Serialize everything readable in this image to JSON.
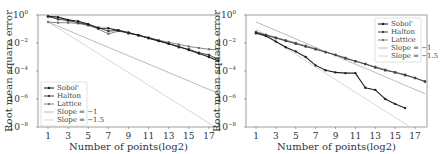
{
  "chart_data": [
    {
      "type": "line",
      "title": "",
      "xlabel": "Number of points(log2)",
      "ylabel": "Root mean square error",
      "yscale": "log",
      "xlim": [
        0,
        18
      ],
      "ylim": [
        1e-08,
        1
      ],
      "x_ticks": [
        "1",
        "3",
        "5",
        "7",
        "9",
        "11",
        "13",
        "15",
        "17"
      ],
      "y_ticks": [
        "10^0",
        "10^-2",
        "10^-4",
        "10^-6",
        "10^-8"
      ],
      "legend_position": "lower left",
      "grid": false,
      "x": [
        1,
        2,
        3,
        4,
        5,
        6,
        7,
        8,
        9,
        10,
        11,
        12,
        13,
        14,
        15,
        16,
        17,
        18
      ],
      "series": [
        {
          "name": "Sobol'",
          "log10_values": [
            -0.1,
            -0.15,
            -0.35,
            -0.45,
            -0.65,
            -0.95,
            -0.95,
            -1.1,
            -1.25,
            -1.45,
            -1.65,
            -1.85,
            -2.05,
            -2.25,
            -2.5,
            -2.75,
            -3.0,
            -3.3
          ]
        },
        {
          "name": "Halton",
          "log10_values": [
            -0.1,
            -0.3,
            -0.4,
            -0.55,
            -0.7,
            -0.9,
            -1.15,
            -1.1,
            -1.3,
            -1.45,
            -1.65,
            -1.85,
            -2.05,
            -2.3,
            -2.45,
            -2.7,
            -2.85,
            -3.2
          ]
        },
        {
          "name": "Lattice",
          "log10_values": [
            -0.5,
            -0.55,
            -0.55,
            -0.6,
            -0.75,
            -1.0,
            -1.35,
            -1.15,
            -1.3,
            -1.45,
            -1.6,
            -1.8,
            -1.95,
            -2.1,
            -2.25,
            -2.35,
            -2.45,
            -2.5
          ]
        },
        {
          "name": "Slope = -1",
          "log10_values": [
            -0.5,
            -0.8,
            -1.1,
            -1.4,
            -1.71,
            -2.01,
            -2.31,
            -2.61,
            -2.91,
            -3.21,
            -3.51,
            -3.81,
            -4.11,
            -4.41,
            -4.71,
            -5.02,
            -5.32,
            -5.62
          ]
        },
        {
          "name": "Slope = -1.5",
          "log10_values": [
            -0.5,
            -0.95,
            -1.4,
            -1.85,
            -2.31,
            -2.76,
            -3.21,
            -3.66,
            -4.11,
            -4.56,
            -5.02,
            -5.47,
            -5.92,
            -6.37,
            -6.82,
            -7.27,
            -7.73,
            -8.18
          ]
        }
      ]
    },
    {
      "type": "line",
      "title": "",
      "xlabel": "Number of points(log2)",
      "ylabel": "Root mean square error",
      "yscale": "log",
      "xlim": [
        0.5,
        18
      ],
      "ylim": [
        1e-08,
        1
      ],
      "x_ticks": [
        "1",
        "3",
        "5",
        "7",
        "9",
        "11",
        "13",
        "15",
        "17"
      ],
      "y_ticks": [
        "10^0",
        "10^-2",
        "10^-4",
        "10^-6",
        "10^-8"
      ],
      "legend_position": "upper right",
      "grid": false,
      "x": [
        1,
        2,
        3,
        4,
        5,
        6,
        7,
        8,
        9,
        10,
        11,
        12,
        13,
        14,
        15,
        16,
        17,
        18
      ],
      "series": [
        {
          "name": "Sobol'",
          "log10_values": [
            -1.3,
            -1.5,
            -1.9,
            -2.3,
            -2.6,
            -3.0,
            -3.6,
            -3.95,
            -4.1,
            -4.15,
            -4.15,
            -5.2,
            -5.35,
            -6.0,
            -6.35,
            -6.65,
            null,
            null
          ]
        },
        {
          "name": "Halton",
          "log10_values": [
            -1.25,
            -1.45,
            -1.65,
            -1.85,
            -2.05,
            -2.25,
            -2.45,
            -2.65,
            -2.85,
            -3.1,
            -3.3,
            -3.5,
            -3.75,
            -3.95,
            -4.1,
            -4.3,
            -4.5,
            -4.75
          ]
        },
        {
          "name": "Lattice",
          "log10_values": [
            -1.2,
            -1.4,
            -1.6,
            -1.8,
            -2.0,
            -2.2,
            -2.4,
            -2.65,
            -2.85,
            -3.05,
            -3.3,
            -3.5,
            -3.7,
            -3.9,
            -4.1,
            -4.25,
            -4.5,
            -4.75
          ]
        },
        {
          "name": "Slope = -1",
          "log10_values": [
            -0.5,
            -0.8,
            -1.1,
            -1.4,
            -1.71,
            -2.01,
            -2.31,
            -2.61,
            -2.91,
            -3.21,
            -3.51,
            -3.81,
            -4.11,
            -4.41,
            -4.71,
            -5.02,
            -5.32,
            -5.62
          ]
        },
        {
          "name": "Slope = -1.5",
          "log10_values": [
            -1.0,
            -1.45,
            -1.9,
            -2.35,
            -2.81,
            -3.26,
            -3.71,
            -4.16,
            -4.61,
            -5.06,
            -5.52,
            -5.97,
            -6.42,
            -6.87,
            -7.32,
            -7.77,
            -8.23,
            -8.68
          ]
        }
      ]
    }
  ],
  "legend_labels": [
    "Sobol'",
    "Halton",
    "Lattice",
    "Slope = −1",
    "Slope = −1.5"
  ],
  "axis": {
    "xlabel": "Number of points(log2)",
    "ylabel": "Root mean square error",
    "x_ticks": [
      "1",
      "3",
      "5",
      "7",
      "9",
      "11",
      "13",
      "15",
      "17"
    ],
    "y_ticks": [
      "10",
      "10",
      "10",
      "10",
      "10"
    ],
    "y_exps": [
      "0",
      "−2",
      "−4",
      "−6",
      "−8"
    ]
  },
  "colors": {
    "sobol": "#222222",
    "halton": "#444444",
    "lattice": "#777777",
    "slope1": "#aaaaaa",
    "slope15": "#cccccc",
    "frame": "#888888"
  }
}
